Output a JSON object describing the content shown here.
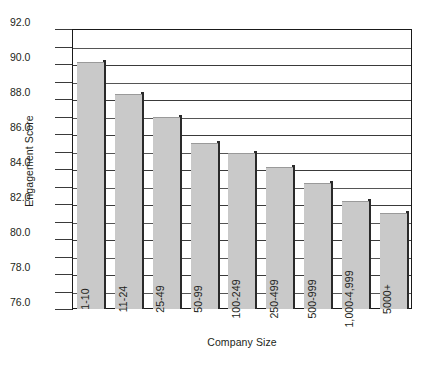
{
  "chart_data": {
    "type": "bar",
    "title": "",
    "xlabel": "Company Size",
    "ylabel": "Engagement Score",
    "categories": [
      "1-10",
      "11-24",
      "25-49",
      "50-99",
      "100-249",
      "250-499",
      "500-999",
      "1,000-4,999",
      "5000+"
    ],
    "values": [
      90.1,
      88.3,
      87.0,
      85.5,
      84.9,
      84.1,
      83.2,
      82.2,
      81.5
    ],
    "ylim": [
      76.0,
      92.0
    ],
    "ytick_labels": [
      "92.0",
      "90.0",
      "88.0",
      "86.0",
      "84.0",
      "82.0",
      "80.0",
      "78.0",
      "76.0"
    ],
    "ytick_values": [
      92.0,
      90.0,
      88.0,
      86.0,
      84.0,
      82.0,
      80.0,
      78.0,
      76.0
    ],
    "minor_tick_values": [
      91.0,
      89.0,
      87.0,
      85.0,
      83.0,
      81.0,
      79.0,
      77.0
    ],
    "grid": true,
    "legend": "none",
    "bar_color": "#c9c9c9",
    "bar_shadow_color": "#2a2a2a",
    "axis_color": "#1a1a1a",
    "text_color": "#231f20"
  },
  "axes": {
    "y_title": "Engagement Score",
    "x_title": "Company Size"
  }
}
